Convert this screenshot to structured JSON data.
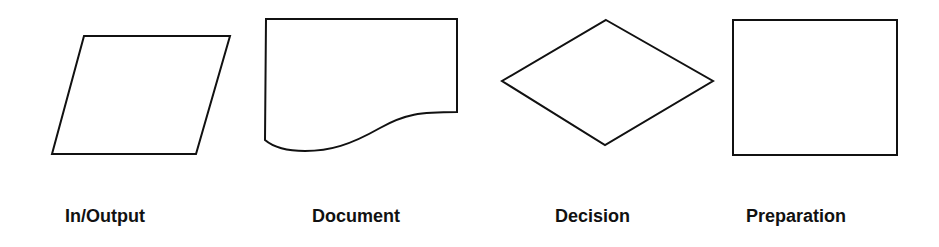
{
  "diagram": {
    "colors": {
      "stroke": "#111111",
      "fill": "#ffffff",
      "text": "#111111"
    },
    "symbols": [
      {
        "id": "inoutput",
        "label": "In/Output",
        "shape": "parallelogram"
      },
      {
        "id": "document",
        "label": "Document",
        "shape": "document"
      },
      {
        "id": "decision",
        "label": "Decision",
        "shape": "diamond"
      },
      {
        "id": "preparation",
        "label": "Preparation",
        "shape": "rectangle"
      }
    ]
  }
}
